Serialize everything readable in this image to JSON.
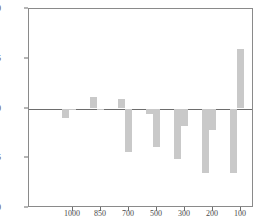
{
  "chart_data": {
    "type": "bar",
    "title": "",
    "subtitle": "",
    "xlabel": "",
    "ylabel": "",
    "xlim": [
      1075,
      25
    ],
    "ylim": [
      200,
      300
    ],
    "yticks": [
      200,
      225,
      250,
      275,
      300
    ],
    "xticks": [
      1000,
      850,
      700,
      500,
      300,
      200,
      100
    ],
    "grid": false,
    "legend": null,
    "baseline": 250,
    "bar_color": "#c9c9c9",
    "axis_color": "#6d6d6d",
    "categories": [
      "1000",
      "850",
      "700",
      "500",
      "300",
      "200",
      "100"
    ],
    "series": [
      {
        "name": "bar-a",
        "values": [
          245.0,
          256.0,
          255.0,
          247.0,
          224.5,
          217.5,
          217.5
        ]
      },
      {
        "name": "bar-b",
        "values": [
          250.0,
          249.5,
          228.0,
          230.5,
          241.0,
          239.0,
          280.0
        ]
      }
    ],
    "bars": [
      {
        "group": "1000",
        "series": "bar-a",
        "value": 245.0,
        "x_px": 61,
        "w_px": 7
      },
      {
        "group": "1000",
        "series": "bar-b",
        "value": 250.0,
        "x_px": 68,
        "w_px": 7
      },
      {
        "group": "850",
        "series": "bar-a",
        "value": 256.0,
        "x_px": 89,
        "w_px": 7
      },
      {
        "group": "850",
        "series": "bar-b",
        "value": 249.5,
        "x_px": 96,
        "w_px": 7
      },
      {
        "group": "700",
        "series": "bar-a",
        "value": 255.0,
        "x_px": 117,
        "w_px": 7
      },
      {
        "group": "700",
        "series": "bar-b",
        "value": 228.0,
        "x_px": 124,
        "w_px": 7
      },
      {
        "group": "500",
        "series": "bar-a",
        "value": 247.0,
        "x_px": 145,
        "w_px": 7
      },
      {
        "group": "500",
        "series": "bar-b",
        "value": 230.5,
        "x_px": 152,
        "w_px": 7
      },
      {
        "group": "300",
        "series": "bar-a",
        "value": 224.5,
        "x_px": 173,
        "w_px": 7
      },
      {
        "group": "300",
        "series": "bar-b",
        "value": 241.0,
        "x_px": 180,
        "w_px": 7
      },
      {
        "group": "200",
        "series": "bar-a",
        "value": 217.5,
        "x_px": 201,
        "w_px": 7
      },
      {
        "group": "200",
        "series": "bar-b",
        "value": 239.0,
        "x_px": 208,
        "w_px": 7
      },
      {
        "group": "100",
        "series": "bar-a",
        "value": 217.5,
        "x_px": 229,
        "w_px": 7
      },
      {
        "group": "100",
        "series": "bar-b",
        "value": 280.0,
        "x_px": 236,
        "w_px": 7
      }
    ],
    "xtick_px": [
      72,
      100,
      128,
      156,
      184,
      212,
      240
    ]
  }
}
